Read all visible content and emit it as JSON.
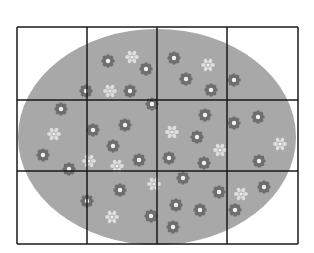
{
  "figure": {
    "grid": {
      "columns": 4,
      "rows": 3,
      "x": [
        17,
        87,
        157,
        227,
        298
      ],
      "y": [
        27,
        100,
        171,
        244
      ],
      "line_color": "#1a1a1a"
    },
    "ellipse": {
      "cx": 157,
      "cy": 137,
      "rx": 139,
      "ry": 108,
      "fill": "#a8a8a8"
    },
    "flower_colors": {
      "dark": "#6e6e6e",
      "light": "#dedede",
      "center": "#f0f0f0"
    },
    "flowers": [
      [
        108,
        61,
        "d"
      ],
      [
        132,
        57,
        "l"
      ],
      [
        146,
        69,
        "d"
      ],
      [
        174,
        58,
        "d"
      ],
      [
        208,
        65,
        "l"
      ],
      [
        186,
        79,
        "d"
      ],
      [
        234,
        80,
        "d"
      ],
      [
        86,
        91,
        "d"
      ],
      [
        110,
        91,
        "l"
      ],
      [
        130,
        91,
        "d"
      ],
      [
        211,
        90,
        "d"
      ],
      [
        152,
        104,
        "d"
      ],
      [
        61,
        109,
        "d"
      ],
      [
        93,
        130,
        "d"
      ],
      [
        125,
        125,
        "d"
      ],
      [
        205,
        115,
        "d"
      ],
      [
        234,
        123,
        "d"
      ],
      [
        258,
        117,
        "d"
      ],
      [
        54,
        134,
        "l"
      ],
      [
        172,
        132,
        "l"
      ],
      [
        197,
        137,
        "d"
      ],
      [
        113,
        146,
        "d"
      ],
      [
        220,
        150,
        "l"
      ],
      [
        280,
        144,
        "l"
      ],
      [
        43,
        155,
        "d"
      ],
      [
        139,
        160,
        "d"
      ],
      [
        169,
        158,
        "d"
      ],
      [
        89,
        161,
        "l"
      ],
      [
        117,
        166,
        "l"
      ],
      [
        204,
        163,
        "d"
      ],
      [
        259,
        161,
        "d"
      ],
      [
        69,
        169,
        "d"
      ],
      [
        183,
        178,
        "d"
      ],
      [
        154,
        184,
        "l"
      ],
      [
        120,
        190,
        "d"
      ],
      [
        219,
        192,
        "d"
      ],
      [
        241,
        194,
        "l"
      ],
      [
        264,
        187,
        "d"
      ],
      [
        87,
        201,
        "d"
      ],
      [
        176,
        205,
        "d"
      ],
      [
        200,
        210,
        "d"
      ],
      [
        235,
        210,
        "d"
      ],
      [
        151,
        216,
        "d"
      ],
      [
        112,
        217,
        "l"
      ],
      [
        173,
        227,
        "d"
      ]
    ]
  }
}
